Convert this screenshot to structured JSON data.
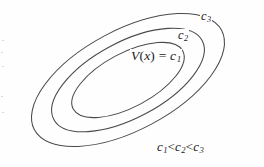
{
  "figure": {
    "name": "lyapunov-level-sets",
    "background_color": "#fefefe",
    "stroke_color": "#4a4a4a",
    "text_color": "#1c1c1c",
    "width": 264,
    "height": 167
  },
  "labels": {
    "inner_contour": {
      "function_name": "V",
      "argument": "x",
      "equals": "=",
      "level": "c",
      "level_index": "1",
      "full_text": "V(x) = c1"
    },
    "middle_contour": {
      "level": "c",
      "level_index": "2",
      "full_text": "c2"
    },
    "outer_contour": {
      "level": "c",
      "level_index": "3",
      "full_text": "c3"
    },
    "ordering": {
      "c1": "c",
      "c1_index": "1",
      "lt1": "<",
      "c2": "c",
      "c2_index": "2",
      "lt2": "<",
      "c3": "c",
      "c3_index": "3",
      "full_text": "c1 < c2 < c3"
    }
  },
  "chart_data": {
    "type": "contour",
    "title": "",
    "xlabel": "",
    "ylabel": "",
    "center": [
      128,
      80
    ],
    "rotation_deg": -28,
    "contours": [
      {
        "label": "c1",
        "level_order": 1,
        "rx": 62,
        "ry": 27,
        "label_text": "V(x) = c1"
      },
      {
        "label": "c2",
        "level_order": 2,
        "rx": 84,
        "ry": 38,
        "label_text": "c2"
      },
      {
        "label": "c3",
        "level_order": 3,
        "rx": 106,
        "ry": 50,
        "label_text": "c3"
      }
    ],
    "relation": "c1 < c2 < c3"
  }
}
